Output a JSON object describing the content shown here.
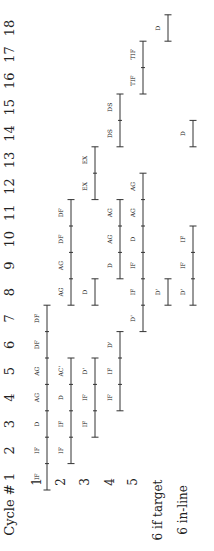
{
  "diagram": {
    "header_label": "Cycle #",
    "cycles": [
      1,
      2,
      3,
      4,
      5,
      6,
      7,
      8,
      9,
      10,
      11,
      12,
      13,
      14,
      15,
      16,
      17,
      18
    ],
    "rows": [
      {
        "label": "1",
        "segments": [
          {
            "stage": "IF",
            "cycle": 1
          },
          {
            "stage": "IF",
            "cycle": 2
          },
          {
            "stage": "D",
            "cycle": 3
          },
          {
            "stage": "AG",
            "cycle": 4
          },
          {
            "stage": "AG",
            "cycle": 5
          },
          {
            "stage": "DF",
            "cycle": 6
          },
          {
            "stage": "DF",
            "cycle": 7
          }
        ]
      },
      {
        "label": "2",
        "segments": [
          {
            "stage": "IF",
            "cycle": 2
          },
          {
            "stage": "IF",
            "cycle": 3
          },
          {
            "stage": "D",
            "cycle": 4
          },
          {
            "stage": "AC'",
            "cycle": 5
          },
          {
            "stage": "AG",
            "cycle": 8
          },
          {
            "stage": "AG",
            "cycle": 9
          },
          {
            "stage": "DF",
            "cycle": 10
          },
          {
            "stage": "DF",
            "cycle": 11
          }
        ]
      },
      {
        "label": "3",
        "segments": [
          {
            "stage": "IF",
            "cycle": 3
          },
          {
            "stage": "IF",
            "cycle": 4
          },
          {
            "stage": "D'",
            "cycle": 5
          },
          {
            "stage": "D",
            "cycle": 8
          },
          {
            "stage": "EX",
            "cycle": 12
          },
          {
            "stage": "EX",
            "cycle": 13
          }
        ]
      },
      {
        "label": "4",
        "segments": [
          {
            "stage": "IF",
            "cycle": 4
          },
          {
            "stage": "IF",
            "cycle": 5
          },
          {
            "stage": "D'",
            "cycle": 6
          },
          {
            "stage": "D",
            "cycle": 9
          },
          {
            "stage": "AG",
            "cycle": 10
          },
          {
            "stage": "AG",
            "cycle": 11
          },
          {
            "stage": "DS",
            "cycle": 14
          },
          {
            "stage": "DS",
            "cycle": 15
          }
        ]
      },
      {
        "label": "5",
        "segments": [
          {
            "stage": "D'",
            "cycle": 7
          },
          {
            "stage": "IF",
            "cycle": 8
          },
          {
            "stage": "IF",
            "cycle": 9
          },
          {
            "stage": "D",
            "cycle": 10
          },
          {
            "stage": "AG",
            "cycle": 11
          },
          {
            "stage": "AG",
            "cycle": 12
          },
          {
            "stage": "TIF",
            "cycle": 16
          },
          {
            "stage": "TIF",
            "cycle": 17
          }
        ]
      },
      {
        "label": "6  if target",
        "segments": [
          {
            "stage": "D'",
            "cycle": 8
          },
          {
            "stage": "D",
            "cycle": 18
          }
        ]
      },
      {
        "label": "6  in-line",
        "segments": [
          {
            "stage": "D'",
            "cycle": 8
          },
          {
            "stage": "IF",
            "cycle": 9
          },
          {
            "stage": "IF",
            "cycle": 10
          },
          {
            "stage": "D",
            "cycle": 14
          }
        ]
      }
    ]
  }
}
